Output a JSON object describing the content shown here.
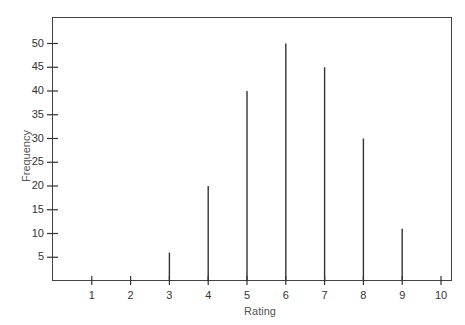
{
  "chart_data": {
    "type": "bar",
    "title": "",
    "xlabel": "Rating",
    "ylabel": "Frequency",
    "categories": [
      "1",
      "2",
      "3",
      "4",
      "5",
      "6",
      "7",
      "8",
      "9",
      "10"
    ],
    "values": [
      0,
      0,
      6,
      20,
      40,
      50,
      45,
      30,
      11,
      0
    ],
    "yticks": [
      5,
      10,
      15,
      20,
      25,
      30,
      35,
      40,
      45,
      50
    ],
    "ylim": [
      0,
      55
    ],
    "xlim": [
      0,
      10.3
    ],
    "grid": false,
    "legend": null,
    "style": "spike/line bars"
  },
  "colors": {
    "line": "#333333",
    "frame": "#444444",
    "text": "#333333"
  }
}
